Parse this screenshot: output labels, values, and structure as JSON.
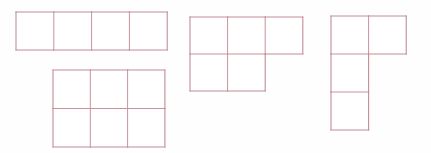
{
  "canvas": {
    "width": 431,
    "height": 153,
    "background_color": "#fefefe",
    "description": "Four polyomino grid figures drawn as thin outlined squares"
  },
  "style": {
    "line_color": "#c28d96",
    "inner_line_color": "#c9929b",
    "cell_fill": "#ffffff",
    "stroke_width": 1.1,
    "inner_stroke_width": 1.0
  },
  "figures": [
    {
      "id": "figure-1",
      "name": "four-in-a-row-strip",
      "label": "I-tetromino 4x1",
      "origin": {
        "x": 16,
        "y": 12
      },
      "cell": {
        "w": 37.8,
        "h": 38
      },
      "rows": 1,
      "cols": 4,
      "cells": [
        [
          0,
          0
        ],
        [
          1,
          0
        ],
        [
          2,
          0
        ],
        [
          3,
          0
        ]
      ]
    },
    {
      "id": "figure-2",
      "name": "three-by-two-rectangle",
      "label": "Rectangle 3x2",
      "origin": {
        "x": 53,
        "y": 70
      },
      "cell": {
        "w": 37.3,
        "h": 38.5
      },
      "rows": 2,
      "cols": 3,
      "cells": [
        [
          0,
          0
        ],
        [
          1,
          0
        ],
        [
          2,
          0
        ],
        [
          0,
          1
        ],
        [
          1,
          1
        ],
        [
          2,
          1
        ]
      ]
    },
    {
      "id": "figure-3",
      "name": "p-pentomino",
      "label": "P-pentomino: top row of 3, bottom row of 2",
      "origin": {
        "x": 190,
        "y": 17
      },
      "cell": {
        "w": 37.6,
        "h": 37
      },
      "rows": 2,
      "cols": 3,
      "cells": [
        [
          0,
          0
        ],
        [
          1,
          0
        ],
        [
          2,
          0
        ],
        [
          0,
          1
        ],
        [
          1,
          1
        ]
      ]
    },
    {
      "id": "figure-4",
      "name": "j-tetromino-vertical",
      "label": "J-tetromino: top row of 2, left column of 3",
      "origin": {
        "x": 331,
        "y": 16
      },
      "cell": {
        "w": 37.6,
        "h": 38
      },
      "rows": 3,
      "cols": 2,
      "cells": [
        [
          0,
          0
        ],
        [
          1,
          0
        ],
        [
          0,
          1
        ],
        [
          0,
          2
        ]
      ]
    }
  ]
}
